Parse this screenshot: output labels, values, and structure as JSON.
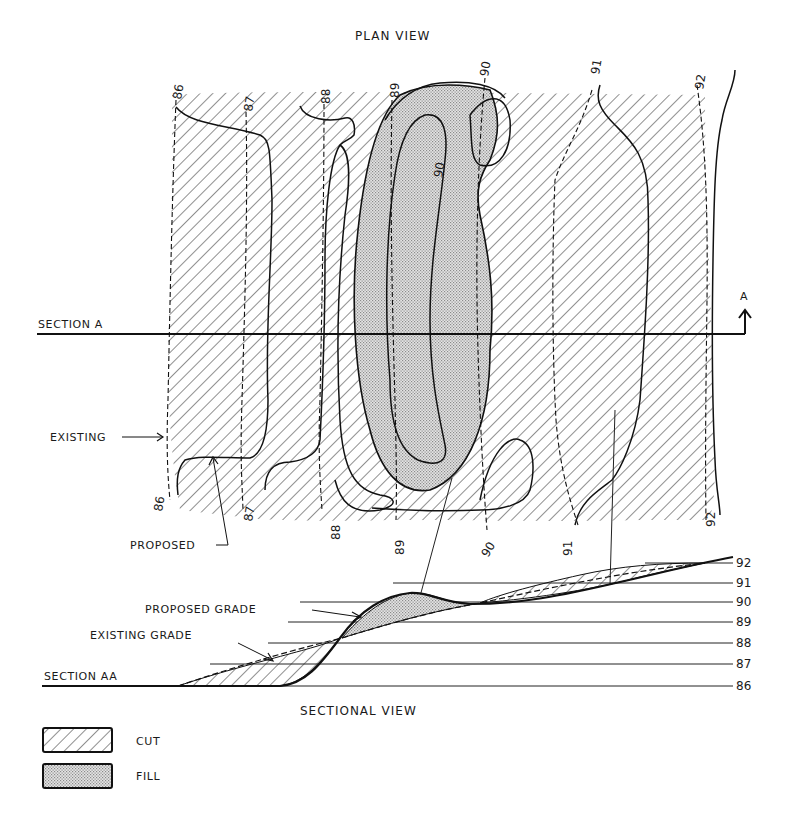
{
  "plan_view": {
    "title": "PLAN VIEW",
    "section_label": "SECTION A",
    "section_marker": "A",
    "callouts": {
      "existing": "EXISTING",
      "proposed": "PROPOSED"
    },
    "existing_contours_top": [
      "86",
      "87",
      "88",
      "89",
      "90",
      "91",
      "92"
    ],
    "existing_contours_bottom": [
      "86",
      "87",
      "88",
      "89",
      "90",
      "91",
      "92"
    ],
    "inner_contour_label": "90"
  },
  "sectional_view": {
    "title": "SECTIONAL VIEW",
    "section_label": "SECTION AA",
    "callouts": {
      "proposed_grade": "PROPOSED GRADE",
      "existing_grade": "EXISTING GRADE"
    },
    "elevations": [
      "92",
      "91",
      "90",
      "89",
      "88",
      "87",
      "86"
    ]
  },
  "legend": {
    "items": [
      {
        "pattern": "hatch",
        "label": "CUT"
      },
      {
        "pattern": "stipple",
        "label": "FILL"
      }
    ]
  },
  "colors": {
    "ink": "#1a1a1a",
    "fill_stipple": "#cfcfcf",
    "background": "#ffffff"
  }
}
